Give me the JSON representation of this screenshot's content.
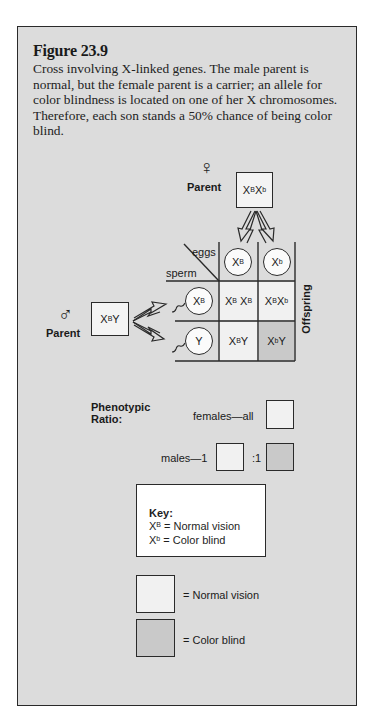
{
  "figure": {
    "title": "Figure 23.9",
    "caption": "Cross involving X-linked genes. The male parent is normal, but the female parent is a carrier; an allele for color blindness is located on one of her X chromosomes. Therefore, each son stands a 50% chance of being color blind."
  },
  "female_parent": {
    "symbol": "♀",
    "label": "Parent",
    "genotype": {
      "base1": "X",
      "sup1": "B",
      "base2": "X",
      "sup2": "b"
    }
  },
  "male_parent": {
    "symbol": "♂",
    "label": "Parent",
    "genotype": {
      "base1": "X",
      "sup1": "B",
      "base2": "Y"
    }
  },
  "punnett": {
    "eggs_label": "eggs",
    "sperm_label": "sperm",
    "offspring_label": "Offspring",
    "eggs": [
      {
        "base": "X",
        "sup": "B"
      },
      {
        "base": "X",
        "sup": "b"
      }
    ],
    "sperm": [
      {
        "base": "X",
        "sup": "B"
      },
      {
        "base": "Y",
        "sup": ""
      }
    ],
    "cells": [
      [
        {
          "a": "X",
          "as": "B",
          "b": "X",
          "bs": "B",
          "phenotype": "normal"
        },
        {
          "a": "X",
          "as": "B",
          "b": "X",
          "bs": "b",
          "phenotype": "normal"
        }
      ],
      [
        {
          "a": "X",
          "as": "B",
          "b": "Y",
          "bs": "",
          "phenotype": "normal"
        },
        {
          "a": "X",
          "as": "b",
          "b": "Y",
          "bs": "",
          "phenotype": "color-blind"
        }
      ]
    ]
  },
  "phenotypic_ratio": {
    "title_line1": "Phenotypic",
    "title_line2": "Ratio:",
    "females_label": "females—all",
    "males_label": "males—1",
    "males_ratio_sep": ":1"
  },
  "key": {
    "title": "Key:",
    "entries": [
      {
        "base": "X",
        "sup": "B",
        "meaning": "= Normal vision"
      },
      {
        "base": "X",
        "sup": "b",
        "meaning": "= Color blind"
      }
    ]
  },
  "legend": [
    {
      "label": "= Normal vision",
      "color": "#f1f1f1"
    },
    {
      "label": "= Color blind",
      "color": "#c9c9c9"
    }
  ],
  "colors": {
    "panel_bg": "#dcdcdc",
    "normal_fill": "#f1f1f1",
    "color_blind_fill": "#c9c9c9",
    "line": "#2a2a2a"
  }
}
